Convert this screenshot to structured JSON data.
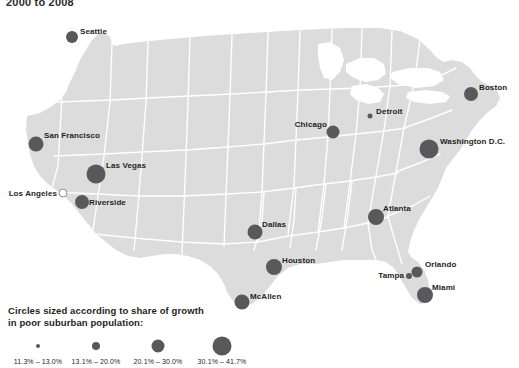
{
  "title": "2000 to 2008",
  "map": {
    "land_color": "#dcdcdc",
    "border_color": "#ffffff",
    "background_color": "#ffffff",
    "dot_color": "#59595b",
    "hollow_dot_color": "#ffffff"
  },
  "legend": {
    "heading_line1": "Circles sized according to share of growth",
    "heading_line2": "in poor suburban population:",
    "bins": [
      {
        "label": "11.3% – 13.0%",
        "size": 4
      },
      {
        "label": "13.1% – 20.0%",
        "size": 8
      },
      {
        "label": "20.1% – 30.0%",
        "size": 13
      },
      {
        "label": "30.1% – 41.7%",
        "size": 19
      }
    ]
  },
  "chart_data": {
    "type": "scatter",
    "title": "2000 to 2008",
    "xlabel": "",
    "ylabel": "",
    "legend_title": "Circles sized according to share of growth in poor suburban population:",
    "value_unit": "percent",
    "size_bins": [
      "11.3% – 13.0%",
      "13.1% – 20.0%",
      "20.1% – 30.0%",
      "30.1% – 41.7%"
    ],
    "points": [
      {
        "name": "Seattle",
        "x": 72,
        "y": 31,
        "r": 6.0,
        "bin": 2,
        "label_pos": "l",
        "lx": 80,
        "ly": 25
      },
      {
        "name": "San Francisco",
        "x": 36,
        "y": 138,
        "r": 7.5,
        "bin": 2,
        "label_pos": "l",
        "lx": 44,
        "ly": 129
      },
      {
        "name": "Los Angeles",
        "x": 63,
        "y": 187,
        "r": 3.5,
        "bin": 0,
        "label_pos": "r",
        "lx": 57,
        "ly": 187,
        "hollow": true
      },
      {
        "name": "Las Vegas",
        "x": 96,
        "y": 168,
        "r": 9.5,
        "bin": 3,
        "label_pos": "l",
        "lx": 106,
        "ly": 159
      },
      {
        "name": "Riverside",
        "x": 82,
        "y": 196,
        "r": 7.0,
        "bin": 2,
        "label_pos": "l",
        "lx": 89,
        "ly": 196
      },
      {
        "name": "Dallas",
        "x": 255,
        "y": 226,
        "r": 7.5,
        "bin": 2,
        "label_pos": "l",
        "lx": 262,
        "ly": 218
      },
      {
        "name": "McAllen",
        "x": 242,
        "y": 296,
        "r": 7.5,
        "bin": 2,
        "label_pos": "l",
        "lx": 250,
        "ly": 290
      },
      {
        "name": "Houston",
        "x": 274,
        "y": 261,
        "r": 8.0,
        "bin": 3,
        "label_pos": "l",
        "lx": 282,
        "ly": 254
      },
      {
        "name": "Chicago",
        "x": 333,
        "y": 126,
        "r": 6.5,
        "bin": 2,
        "label_pos": "r",
        "lx": 327,
        "ly": 118
      },
      {
        "name": "Detroit",
        "x": 370,
        "y": 110,
        "r": 2.5,
        "bin": 0,
        "label_pos": "l",
        "lx": 376,
        "ly": 105
      },
      {
        "name": "Boston",
        "x": 471,
        "y": 88,
        "r": 7.0,
        "bin": 2,
        "label_pos": "l",
        "lx": 479,
        "ly": 81
      },
      {
        "name": "Washington D.C.",
        "x": 429,
        "y": 143,
        "r": 9.5,
        "bin": 3,
        "label_pos": "l",
        "lx": 440,
        "ly": 135
      },
      {
        "name": "Atlanta",
        "x": 376,
        "y": 211,
        "r": 8.0,
        "bin": 3,
        "label_pos": "l",
        "lx": 383,
        "ly": 202
      },
      {
        "name": "Tampa",
        "x": 409,
        "y": 270,
        "r": 3.0,
        "bin": 0,
        "label_pos": "r",
        "lx": 404,
        "ly": 269
      },
      {
        "name": "Orlando",
        "x": 417,
        "y": 266,
        "r": 5.5,
        "bin": 1,
        "label_pos": "l",
        "lx": 425,
        "ly": 258
      },
      {
        "name": "Miami",
        "x": 425,
        "y": 289,
        "r": 8.0,
        "bin": 3,
        "label_pos": "l",
        "lx": 432,
        "ly": 281
      }
    ]
  }
}
